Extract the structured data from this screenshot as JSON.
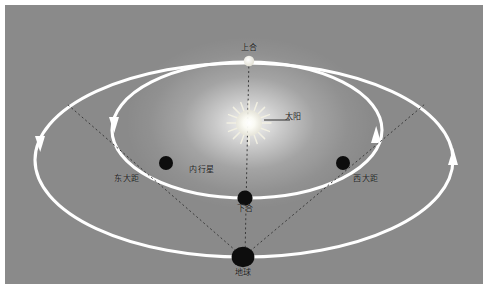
{
  "figure": {
    "panel_background_color": "#8a8a8a",
    "border_color": "#ffffff",
    "orbit_color": "#ffffff",
    "sightline_color": "#3b3b3b",
    "label_color": "#1a1a1a"
  },
  "labels": {
    "sun": "太阳",
    "superior_conjunction": "上合",
    "inferior_conjunction": "下合",
    "greatest_eastern_elongation": "东大距",
    "greatest_western_elongation": "西大距",
    "inner_planet": "内行星",
    "earth": "地球"
  },
  "bodies": [
    {
      "name": "sun",
      "label": "太阳",
      "x": 244,
      "y": 118,
      "fill": "#f2f0e4",
      "kind": "star"
    },
    {
      "name": "superior-conjunction-planet",
      "label": "上合",
      "x": 244,
      "y": 56,
      "fill": "#f7f7f2",
      "kind": "planet-lit"
    },
    {
      "name": "greatest-eastern-elongation-planet",
      "label": "东大距",
      "x": 161,
      "y": 158,
      "fill": "#0d0d0d",
      "kind": "planet-dark"
    },
    {
      "name": "greatest-western-elongation-planet",
      "label": "西大距",
      "x": 338,
      "y": 158,
      "fill": "#0d0d0d",
      "kind": "planet-dark"
    },
    {
      "name": "inferior-conjunction-planet",
      "label": "下合",
      "x": 240,
      "y": 193,
      "fill": "#0d0d0d",
      "kind": "planet-dark"
    },
    {
      "name": "earth",
      "label": "地球",
      "x": 238,
      "y": 252,
      "fill": "#0d0d0d",
      "kind": "planet-dark"
    }
  ],
  "orbits": [
    {
      "name": "earth-orbit",
      "cx": 239,
      "cy": 155,
      "rx": 209,
      "ry": 97,
      "direction": "counterclockwise"
    },
    {
      "name": "inner-planet-orbit",
      "cx": 242,
      "cy": 125,
      "rx": 135,
      "ry": 68,
      "direction": "counterclockwise"
    }
  ],
  "label_positions": {
    "sun": {
      "x": 288,
      "y": 111
    },
    "superior_conjunction": {
      "x": 244,
      "y": 42
    },
    "greatest_eastern_elongation": {
      "x": 122,
      "y": 173
    },
    "greatest_western_elongation": {
      "x": 361,
      "y": 173
    },
    "inner_planet": {
      "x": 197,
      "y": 164
    },
    "inferior_conjunction": {
      "x": 240,
      "y": 203
    },
    "earth": {
      "x": 238,
      "y": 266
    }
  }
}
